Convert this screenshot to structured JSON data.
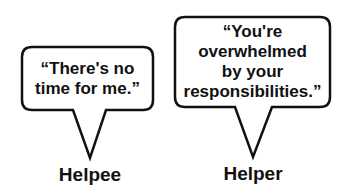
{
  "diagram": {
    "bubbles": [
      {
        "speaker": "Helpee",
        "quote": "“There's no\ntime for me.”"
      },
      {
        "speaker": "Helper",
        "quote": "“You're\noverwhelmed\nby your\nresponsibilities.”"
      }
    ],
    "colors": {
      "stroke": "#111111",
      "fill": "#ffffff",
      "text": "#111111"
    }
  }
}
